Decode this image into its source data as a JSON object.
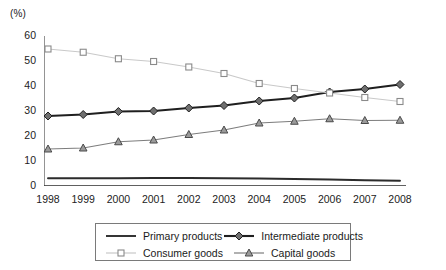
{
  "unit_label": "(%)",
  "legend": {
    "rows": [
      [
        {
          "key": "primary",
          "label": "Primary products"
        },
        {
          "key": "intermediate",
          "label": "Intermediate products"
        }
      ],
      [
        {
          "key": "consumer",
          "label": "Consumer goods"
        },
        {
          "key": "capital",
          "label": "Capital goods"
        }
      ]
    ]
  },
  "colors": {
    "primary": "#2b2b2b",
    "intermediate": "#1f1f1f",
    "consumer": "#c9c9c9",
    "capital": "#7d7d7d",
    "axis": "#2b2b2b",
    "background": "#ffffff"
  },
  "chart_data": {
    "type": "line",
    "title": "",
    "xlabel": "",
    "ylabel": "(%)",
    "categories": [
      "1998",
      "1999",
      "2000",
      "2001",
      "2002",
      "2003",
      "2004",
      "2005",
      "2006",
      "2007",
      "2008"
    ],
    "x": [
      1998,
      1999,
      2000,
      2001,
      2002,
      2003,
      2004,
      2005,
      2006,
      2007,
      2008
    ],
    "ylim": [
      0,
      60
    ],
    "yticks": [
      0,
      10,
      20,
      30,
      40,
      50,
      60
    ],
    "grid": false,
    "legend_position": "bottom",
    "series": [
      {
        "name": "Primary products",
        "key": "primary",
        "marker": "none",
        "color": "#2b2b2b",
        "values": [
          3.1,
          3.1,
          3.1,
          3.2,
          3.2,
          3.1,
          3.0,
          2.8,
          2.6,
          2.3,
          2.1
        ]
      },
      {
        "name": "Intermediate products",
        "key": "intermediate",
        "marker": "diamond",
        "color": "#1f1f1f",
        "values": [
          28.0,
          28.6,
          29.8,
          30.0,
          31.2,
          32.2,
          34.0,
          35.2,
          37.6,
          38.8,
          40.6
        ]
      },
      {
        "name": "Consumer goods",
        "key": "consumer",
        "marker": "square",
        "color": "#c9c9c9",
        "values": [
          54.8,
          53.5,
          50.9,
          49.8,
          47.6,
          45.0,
          41.0,
          39.0,
          37.2,
          35.4,
          33.8
        ]
      },
      {
        "name": "Capital goods",
        "key": "capital",
        "marker": "triangle",
        "color": "#7d7d7d",
        "values": [
          14.8,
          15.2,
          17.7,
          18.4,
          20.6,
          22.4,
          25.2,
          25.9,
          26.9,
          26.2,
          26.3
        ]
      }
    ]
  }
}
